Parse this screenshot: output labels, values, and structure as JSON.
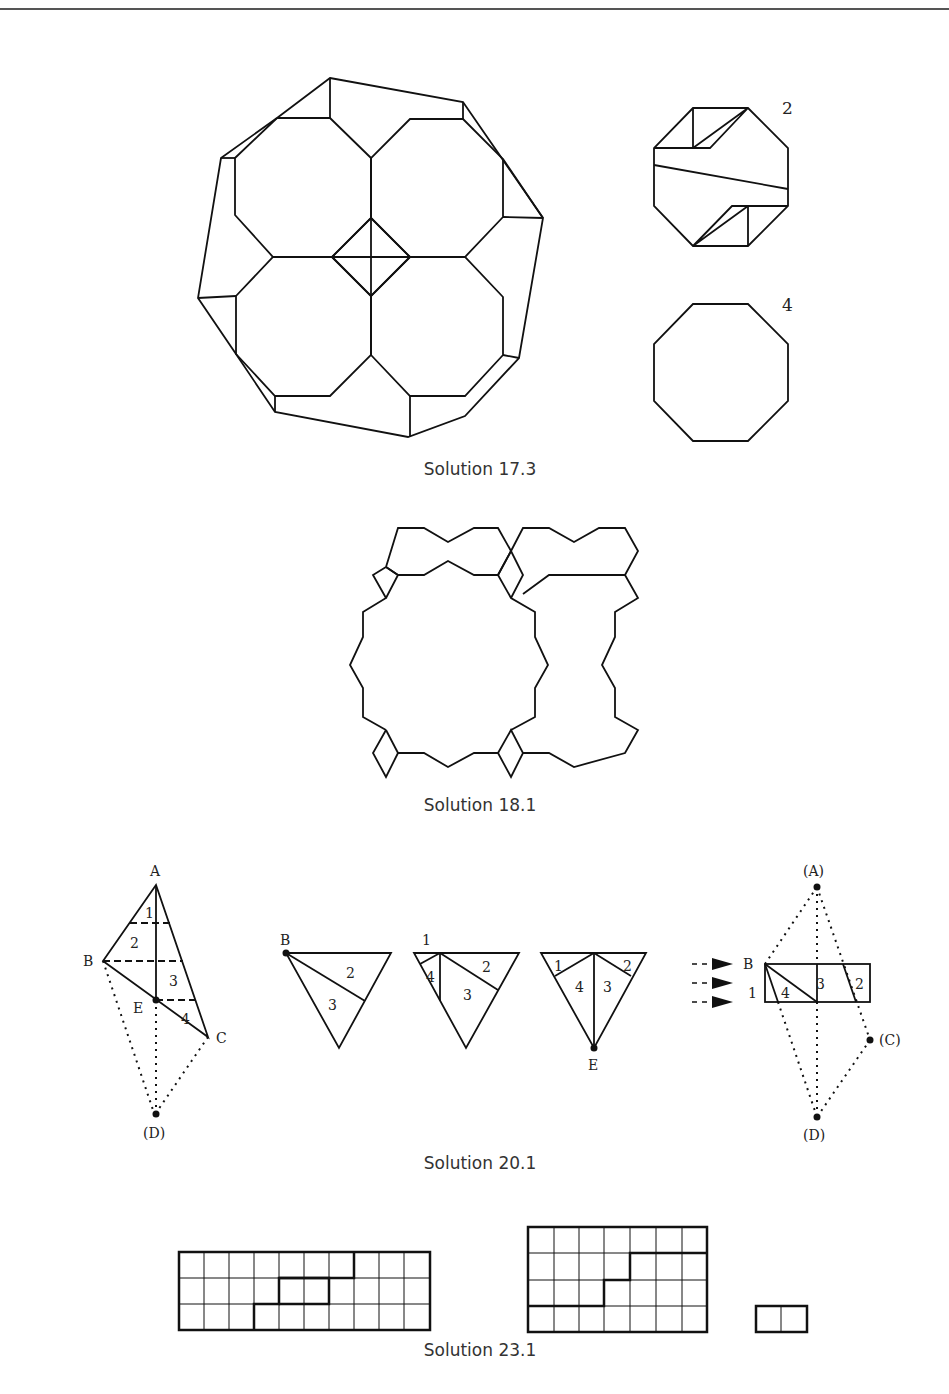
{
  "figures": [
    {
      "id": "17.3",
      "caption": "Solution 17.3",
      "side_labels": [
        "2",
        "4"
      ]
    },
    {
      "id": "18.1",
      "caption": "Solution 18.1"
    },
    {
      "id": "20.1",
      "caption": "Solution 20.1",
      "triangle_labels": {
        "vertices": [
          "A",
          "B",
          "C",
          "E",
          "(D)"
        ],
        "pieces": [
          "1",
          "2",
          "3",
          "4"
        ]
      },
      "step2": {
        "vertex": "B",
        "pieces": [
          "2",
          "3"
        ]
      },
      "step3": {
        "corner": "1",
        "pieces": [
          "4",
          "2",
          "3"
        ]
      },
      "step4": {
        "vertex": "E",
        "pieces": [
          "1",
          "2",
          "4",
          "3"
        ]
      },
      "rect_labels": {
        "points": [
          "(A)",
          "B",
          "(C)",
          "(D)"
        ],
        "pieces": [
          "1",
          "4",
          "3",
          "2"
        ]
      }
    },
    {
      "id": "23.1",
      "caption": "Solution 23.1"
    }
  ]
}
